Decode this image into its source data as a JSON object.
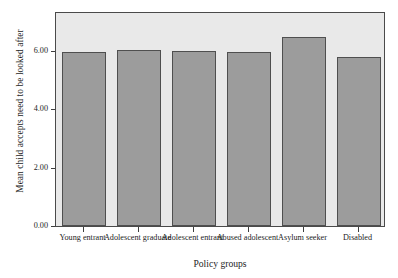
{
  "chart_data": {
    "type": "bar",
    "title": "",
    "xlabel": "Policy groups",
    "ylabel": "Mean child accepts need to be looked after",
    "categories": [
      "Young entrant",
      "Adolescent graduate",
      "Adolescent entrant",
      "Abused adolescent",
      "Asylum seeker",
      "Disabled"
    ],
    "values": [
      5.96,
      6.02,
      6.0,
      5.95,
      6.47,
      5.79
    ],
    "ylim": [
      0.0,
      7.36
    ],
    "yticks": [
      0.0,
      2.0,
      4.0,
      6.0
    ],
    "ytick_labels": [
      "0.00",
      "2.00",
      "4.00",
      "6.00"
    ],
    "grid": false,
    "legend": null,
    "bar_color": "#9c9c9c",
    "bar_edge_color": "#4f4f4f",
    "plot_background": "#e9e9e9",
    "frame_color": "#4a4a4a",
    "figure_background": "#ffffff"
  }
}
